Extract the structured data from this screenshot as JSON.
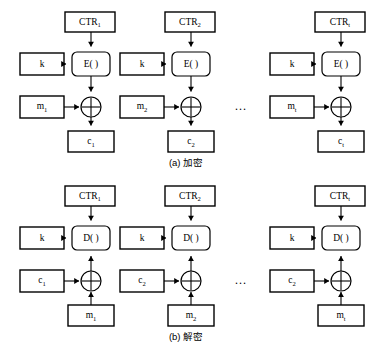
{
  "figure": {
    "background_color": "#ffffff",
    "stroke_color": "#000000",
    "ellipsis": "…"
  },
  "panels": [
    {
      "id": "encryption",
      "caption": "(a) 加密",
      "function_label": "E( )",
      "key_label": "k",
      "ellipsis": "…",
      "columns": [
        {
          "counter_base": "CTR",
          "counter_sub": "1",
          "key": "k",
          "input_base": "m",
          "input_sub": "1",
          "output_base": "c",
          "output_sub": "1"
        },
        {
          "counter_base": "CTR",
          "counter_sub": "2",
          "key": "k",
          "input_base": "m",
          "input_sub": "2",
          "output_base": "c",
          "output_sub": "2"
        },
        {
          "counter_base": "CTR",
          "counter_sub": "t",
          "key": "k",
          "input_base": "m",
          "input_sub": "t",
          "output_base": "c",
          "output_sub": "t"
        }
      ]
    },
    {
      "id": "decryption",
      "caption": "(b) 解密",
      "function_label": "D( )",
      "key_label": "k",
      "ellipsis": "…",
      "columns": [
        {
          "counter_base": "CTR",
          "counter_sub": "1",
          "key": "k",
          "input_base": "c",
          "input_sub": "1",
          "output_base": "m",
          "output_sub": "1"
        },
        {
          "counter_base": "CTR",
          "counter_sub": "2",
          "key": "k",
          "input_base": "c",
          "input_sub": "2",
          "output_base": "m",
          "output_sub": "2"
        },
        {
          "counter_base": "CTR",
          "counter_sub": "t",
          "key": "k",
          "input_base": "c",
          "input_sub": "2",
          "output_base": "m",
          "output_sub": "t"
        }
      ]
    }
  ]
}
